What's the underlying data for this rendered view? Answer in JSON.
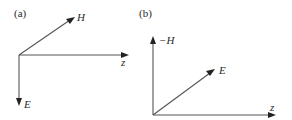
{
  "figure": {
    "panels": [
      {
        "id": "a",
        "label": "(a)",
        "vectors": [
          {
            "name": "H",
            "label": "H",
            "direction": "up-right"
          },
          {
            "name": "z",
            "label": "z",
            "direction": "right"
          },
          {
            "name": "E",
            "label": "E",
            "direction": "down"
          }
        ]
      },
      {
        "id": "b",
        "label": "(b)",
        "vectors": [
          {
            "name": "-H",
            "label": "−H",
            "direction": "up"
          },
          {
            "name": "E",
            "label": "E",
            "direction": "up-right"
          },
          {
            "name": "z",
            "label": "z",
            "direction": "right"
          }
        ]
      }
    ],
    "colors": {
      "line": "#555555",
      "arrowhead": "#222222",
      "text": "#2a2a2a",
      "background": "#ffffff"
    }
  }
}
